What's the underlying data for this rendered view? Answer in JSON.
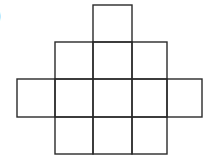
{
  "figure": {
    "label": ")",
    "line_color": "#2a2a2a",
    "rows": [
      {
        "row": 0,
        "cells": [
          2
        ]
      },
      {
        "row": 1,
        "cells": [
          1,
          2,
          3
        ]
      },
      {
        "row": 2,
        "cells": [
          0,
          1,
          2,
          3,
          4
        ]
      },
      {
        "row": 3,
        "cells": [
          1,
          2,
          3
        ]
      }
    ],
    "cell_count": 12
  }
}
